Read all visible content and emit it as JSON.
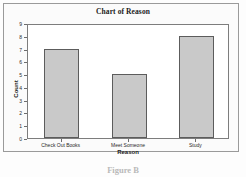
{
  "chart_data": {
    "type": "bar",
    "title": "Chart of Reason",
    "categories": [
      "Check Out Books",
      "Meet Someone",
      "Study"
    ],
    "values": [
      7,
      5,
      8
    ],
    "xlabel": "Reason",
    "ylabel": "Count",
    "ylim": [
      0,
      9
    ],
    "yticks": [
      "0",
      "1",
      "2",
      "3",
      "4",
      "5",
      "6",
      "7",
      "8",
      "9"
    ],
    "grid": false,
    "legend": false,
    "bar_color": "#c9c9c9",
    "bar_border_color": "#5c5c5c"
  },
  "caption": {
    "text": "Figure B"
  }
}
